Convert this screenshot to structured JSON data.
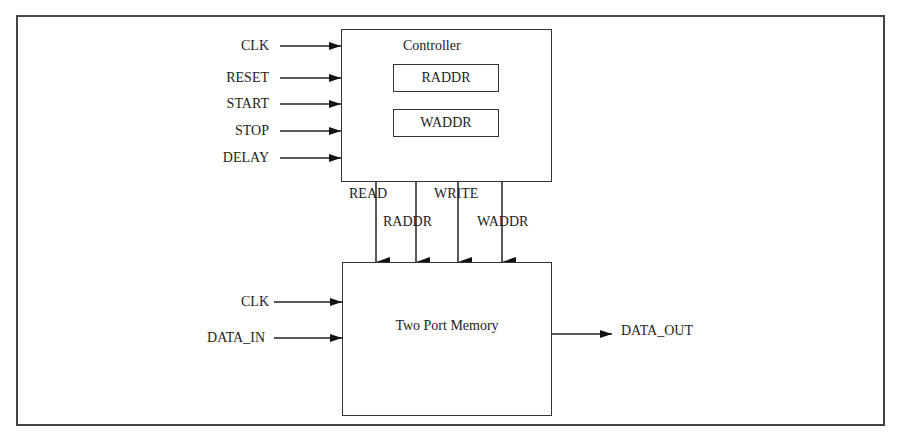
{
  "diagram": {
    "controller": {
      "title": "Controller",
      "registers": [
        "RADDR",
        "WADDR"
      ],
      "inputs": [
        "CLK",
        "RESET",
        "START",
        "STOP",
        "DELAY"
      ]
    },
    "memory": {
      "title": "Two Port Memory",
      "inputs": [
        "CLK",
        "DATA_IN"
      ],
      "output": "DATA_OUT"
    },
    "bus_signals": [
      "READ",
      "RADDR",
      "WRITE",
      "WADDR"
    ]
  }
}
